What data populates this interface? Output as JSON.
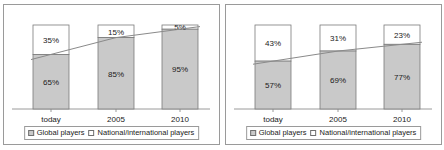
{
  "chart_data": [
    {
      "type": "bar",
      "stacked": true,
      "title": "",
      "subtitle": "",
      "xlabel": "",
      "ylabel": "",
      "ylim": [
        0,
        100
      ],
      "grid": false,
      "legend_position": "bottom",
      "categories": [
        "today",
        "2005",
        "2010"
      ],
      "series": [
        {
          "name": "Global players",
          "values": [
            65,
            85,
            95
          ],
          "color": "#c9c9c9"
        },
        {
          "name": "National/international players",
          "values": [
            35,
            15,
            5
          ],
          "color": "#ffffff"
        }
      ],
      "data_labels": {
        "global": [
          "65%",
          "85%",
          "95%"
        ],
        "national": [
          "35%",
          "15%",
          "5%"
        ]
      },
      "trendline": {
        "name": "boundary-trend",
        "values": [
          65,
          85,
          95
        ]
      }
    },
    {
      "type": "bar",
      "stacked": true,
      "title": "",
      "subtitle": "",
      "xlabel": "",
      "ylabel": "",
      "ylim": [
        0,
        100
      ],
      "grid": false,
      "legend_position": "bottom",
      "categories": [
        "today",
        "2005",
        "2010"
      ],
      "series": [
        {
          "name": "Global players",
          "values": [
            57,
            69,
            77
          ],
          "color": "#c9c9c9"
        },
        {
          "name": "National/international players",
          "values": [
            43,
            31,
            23
          ],
          "color": "#ffffff"
        }
      ],
      "data_labels": {
        "global": [
          "57%",
          "69%",
          "77%"
        ],
        "national": [
          "43%",
          "31%",
          "23%"
        ]
      },
      "trendline": {
        "name": "boundary-trend",
        "values": [
          57,
          69,
          77
        ]
      }
    }
  ],
  "panels": [
    {
      "id": "left-chart",
      "axis_labels": [
        "today",
        "2005",
        "2010"
      ],
      "bars": [
        {
          "category": "today",
          "top_label": "35%",
          "bottom_label": "65%",
          "top_value": 35,
          "bottom_value": 65
        },
        {
          "category": "2005",
          "top_label": "15%",
          "bottom_label": "85%",
          "top_value": 15,
          "bottom_value": 85
        },
        {
          "category": "2010",
          "top_label": "5%",
          "bottom_label": "95%",
          "top_value": 5,
          "bottom_value": 95
        }
      ],
      "legend": [
        {
          "label": "Global players",
          "swatch": "gray"
        },
        {
          "label": "National/international players",
          "swatch": "white"
        }
      ]
    },
    {
      "id": "right-chart",
      "axis_labels": [
        "today",
        "2005",
        "2010"
      ],
      "bars": [
        {
          "category": "today",
          "top_label": "43%",
          "bottom_label": "57%",
          "top_value": 43,
          "bottom_value": 57
        },
        {
          "category": "2005",
          "top_label": "31%",
          "bottom_label": "69%",
          "top_value": 31,
          "bottom_value": 69
        },
        {
          "category": "2010",
          "top_label": "23%",
          "bottom_label": "77%",
          "top_value": 23,
          "bottom_value": 77
        }
      ],
      "legend": [
        {
          "label": "Global players",
          "swatch": "gray"
        },
        {
          "label": "National/international players",
          "swatch": "white"
        }
      ]
    }
  ],
  "colors": {
    "global_fill": "#c9c9c9",
    "national_fill": "#ffffff",
    "bar_stroke": "#7a7a7a",
    "axis": "#9a9a9a",
    "trendline": "#8a8a8a",
    "text": "#1a1a1a",
    "panel_border": "#9a9a9a",
    "background": "#ffffff"
  }
}
